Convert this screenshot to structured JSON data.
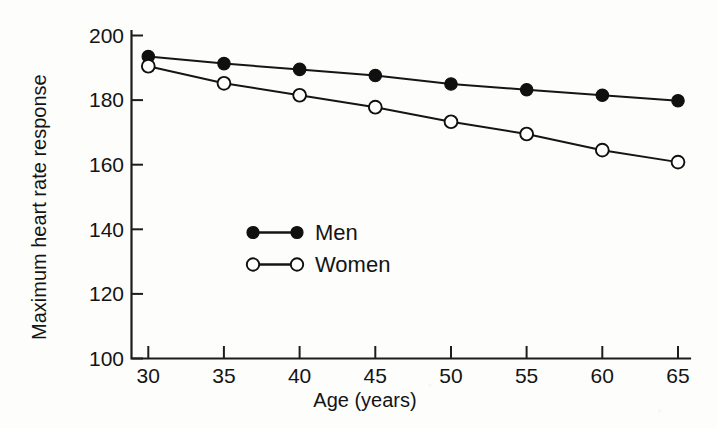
{
  "chart_data": {
    "type": "line",
    "title": "",
    "xlabel": "Age (years)",
    "ylabel": "Maximum heart rate response",
    "x": [
      30,
      35,
      40,
      45,
      50,
      55,
      60,
      65
    ],
    "xticklabels": [
      "30",
      "35",
      "40",
      "45",
      "50",
      "55",
      "60",
      "65"
    ],
    "yticklabels": [
      "100",
      "120",
      "140",
      "160",
      "180",
      "200"
    ],
    "yticks": [
      100,
      120,
      140,
      160,
      180,
      200
    ],
    "xlim": [
      28,
      67
    ],
    "ylim": [
      100,
      200
    ],
    "grid": false,
    "legend_position": "center-left-inside",
    "series": [
      {
        "name": "Men",
        "marker": "filled-circle",
        "color": "#101010",
        "values": [
          193.5,
          191.3,
          189.5,
          187.6,
          185.0,
          183.2,
          181.5,
          179.8
        ]
      },
      {
        "name": "Women",
        "marker": "open-circle",
        "color": "#101010",
        "values": [
          190.5,
          185.2,
          181.5,
          177.8,
          173.3,
          169.5,
          164.5,
          160.8
        ]
      }
    ]
  },
  "legend": {
    "items": [
      {
        "label": "Men",
        "marker": "filled-circle"
      },
      {
        "label": "Women",
        "marker": "open-circle"
      }
    ]
  },
  "axes": {
    "x_title": "Age (years)",
    "y_title": "Maximum heart rate response",
    "x_tick_0": "30",
    "x_tick_1": "35",
    "x_tick_2": "40",
    "x_tick_3": "45",
    "x_tick_4": "50",
    "x_tick_5": "55",
    "x_tick_6": "60",
    "x_tick_7": "65",
    "y_tick_0": "100",
    "y_tick_1": "120",
    "y_tick_2": "140",
    "y_tick_3": "160",
    "y_tick_4": "180",
    "y_tick_5": "200"
  },
  "colors": {
    "ink": "#141414",
    "background": "#fdfdfc"
  }
}
